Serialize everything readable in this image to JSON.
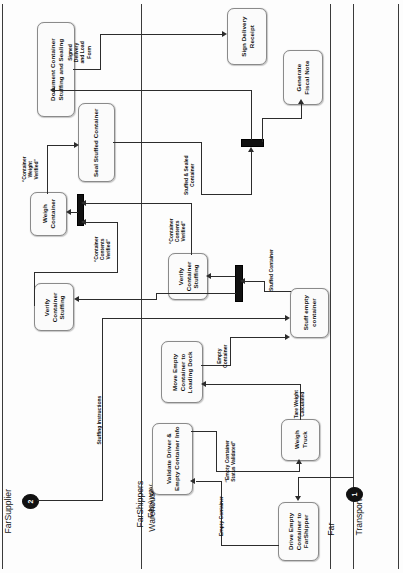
{
  "diagram": {
    "orientation": "rotated-90-ccw",
    "accent_color": "#111111",
    "box_fill": "#fbfbfb",
    "line_color": "#2c2c2c"
  },
  "lanes": [
    {
      "id": "lane-farsupplier",
      "label": "FarSupplier",
      "icon": "org-unit-icon"
    },
    {
      "id": "lane-farshippers",
      "label": "FarShippers\nWarehouse -\nFarAway",
      "label_line1": "FarShippers",
      "label_line2": "Warehouse -",
      "label_line3": "FarAway",
      "icon": "org-unit-icon"
    },
    {
      "id": "lane-fartransport",
      "label": "Far\nTransport",
      "label_line1": "Far",
      "label_line2": "Transport",
      "icon": "org-unit-icon"
    }
  ],
  "events": [
    {
      "id": "event-1",
      "label": "1",
      "lane": "Far Transport",
      "type": "start"
    },
    {
      "id": "event-2",
      "label": "2",
      "lane": "FarSupplier",
      "type": "start"
    }
  ],
  "tasks": [
    {
      "id": "task-document-container",
      "line1": "Document Container",
      "line2": "Stuffing and Sealing",
      "lane": "FarSupplier"
    },
    {
      "id": "task-sign-delivery-receipt",
      "line1": "Sign Delivery",
      "line2": "Receipt",
      "lane": "Far Transport"
    },
    {
      "id": "task-generate-fiscal-note",
      "line1": "Generate",
      "line2": "Fiscal Note",
      "lane": "Far Transport"
    },
    {
      "id": "task-seal-stuffed-container",
      "line1": "Seal Stuffed Container",
      "line2": "",
      "lane": "FarSupplier"
    },
    {
      "id": "task-weigh-container",
      "line1": "Weigh",
      "line2": "Container",
      "lane": "FarSupplier"
    },
    {
      "id": "task-verify-container-stuffing-supplier",
      "line1": "Verify",
      "line2": "Container",
      "line3": "Stuffing",
      "lane": "FarSupplier"
    },
    {
      "id": "task-verify-container-stuffing-shipper",
      "line1": "Verify",
      "line2": "Container",
      "line3": "Stuffing",
      "lane": "FarShippers"
    },
    {
      "id": "task-stuff-empty-container",
      "line1": "Stuff empty",
      "line2": "container",
      "lane": "FarShippers"
    },
    {
      "id": "task-move-empty-container",
      "line1": "Move Empty",
      "line2": "Container to",
      "line3": "Loading Dock",
      "lane": "FarShippers"
    },
    {
      "id": "task-validate-driver",
      "line1": "Validate Driver &",
      "line2": "Empty Container Info",
      "lane": "FarShippers"
    },
    {
      "id": "task-weigh-truck",
      "line1": "Weigh",
      "line2": "Truck",
      "lane": "FarShippers"
    },
    {
      "id": "task-drive-empty-container",
      "line1": "Drive Empty",
      "line2": "Container to",
      "line3": "FarShipper",
      "lane": "Far Transport"
    }
  ],
  "flow_labels": [
    {
      "id": "flow-signed-delivery",
      "line1": "Signed",
      "line2": "Delivery",
      "line3": "and Load",
      "line4": "Form"
    },
    {
      "id": "flow-container-weight-verified",
      "line1": "“Container",
      "line2": "Weight",
      "line3": "Verified”"
    },
    {
      "id": "flow-stuffed-sealed-container",
      "line1": "Stuffed & Sealed",
      "line2": "Container"
    },
    {
      "id": "flow-container-contents-verified-a",
      "line1": "“Container",
      "line2": "Contents",
      "line3": "Verified”"
    },
    {
      "id": "flow-container-contents-verified-b",
      "line1": "“Container",
      "line2": "Contents",
      "line3": "Verified”"
    },
    {
      "id": "flow-stuffed-container",
      "line1": "Stuffed Container",
      "line2": ""
    },
    {
      "id": "flow-stuffing-instructions",
      "line1": "Stuffing Instructions",
      "line2": ""
    },
    {
      "id": "flow-empty-container-dock",
      "line1": "Empty",
      "line2": "Container"
    },
    {
      "id": "flow-tare-weight-calculated",
      "line1": "Tare Weight",
      "line2": "Calculated"
    },
    {
      "id": "flow-empty-container-status-validated",
      "line1": "“Empty Container",
      "line2": "Status Validated”"
    },
    {
      "id": "flow-empty-container",
      "line1": "Empty Container",
      "line2": ""
    }
  ],
  "gateways": [
    {
      "id": "gateway-join-fiscal",
      "type": "parallel-bar"
    },
    {
      "id": "gateway-join-weigh",
      "type": "parallel-bar"
    },
    {
      "id": "gateway-join-verify",
      "type": "parallel-bar"
    }
  ]
}
